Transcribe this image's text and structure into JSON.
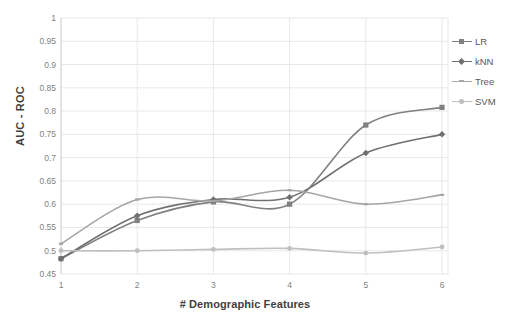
{
  "chart_data": {
    "type": "line",
    "title": "",
    "xlabel": "# Demographic Features",
    "ylabel": "AUC - ROC",
    "x": [
      1,
      2,
      3,
      4,
      5,
      6
    ],
    "xtick_labels": [
      "1",
      "2",
      "3",
      "4",
      "5",
      "6"
    ],
    "ytick_labels": [
      "0.45",
      "0.5",
      "0.55",
      "0.6",
      "0.65",
      "0.7",
      "0.75",
      "0.8",
      "0.85",
      "0.9",
      "0.95",
      "1"
    ],
    "ylim": [
      0.45,
      1
    ],
    "xlim": [
      1,
      6
    ],
    "grid": true,
    "legend_position": "right",
    "series": [
      {
        "name": "LR",
        "marker": "square",
        "color": "#808080",
        "values": [
          0.483,
          0.565,
          0.605,
          0.6,
          0.77,
          0.808
        ]
      },
      {
        "name": "kNN",
        "marker": "diamond",
        "color": "#707070",
        "values": [
          0.483,
          0.575,
          0.61,
          0.615,
          0.71,
          0.75
        ]
      },
      {
        "name": "Tree",
        "marker": "line",
        "color": "#a6a6a6",
        "values": [
          0.515,
          0.61,
          0.607,
          0.63,
          0.6,
          0.62
        ]
      },
      {
        "name": "SVM",
        "marker": "circle",
        "color": "#bfbfbf",
        "values": [
          0.5,
          0.5,
          0.503,
          0.505,
          0.495,
          0.508
        ]
      }
    ]
  },
  "axes": {
    "y_title": "AUC - ROC",
    "x_title": "# Demographic Features"
  },
  "legend": {
    "items": [
      {
        "label": "LR"
      },
      {
        "label": "kNN"
      },
      {
        "label": "Tree"
      },
      {
        "label": "SVM"
      }
    ]
  },
  "colors": {
    "grid": "#e8e8e8",
    "axis": "#d9d9d9",
    "tick_text": "#7f7f7f",
    "title_text": "#3f3f3f",
    "background": "#ffffff"
  }
}
